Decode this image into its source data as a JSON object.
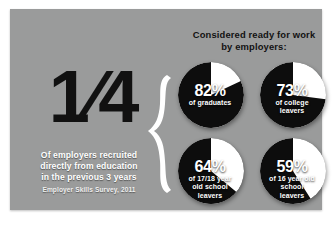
{
  "poster": {
    "background_color": "#9a9b9b",
    "page_background_color": "#ffffff"
  },
  "headline": {
    "fraction": "1⁄4",
    "statement_lines": [
      "Of employers recruited",
      "directly from education",
      "in the previous 3 years"
    ],
    "source": "Employer Skills Survey, 2011",
    "brace_icon": "curly-brace-icon"
  },
  "header": {
    "lines": [
      "Considered ready for work",
      "by employers:"
    ]
  },
  "chart_data": {
    "type": "pie",
    "title": "Considered ready for work by employers:",
    "subtitle": "1/4 of employers recruited directly from education in the previous 3 years",
    "source": "Employer Skills Survey, 2011",
    "value_unit": "%",
    "colors": {
      "filled": "#0d0d0d",
      "remainder": "#ffffff",
      "label": "#ffffff"
    },
    "legend": "none",
    "series": [
      {
        "name": "of graduates",
        "percent": 82,
        "label": "82%",
        "sub_lines": [
          "of graduates"
        ]
      },
      {
        "name": "of college leavers",
        "percent": 73,
        "label": "73%",
        "sub_lines": [
          "of college",
          "leavers"
        ]
      },
      {
        "name": "of 17/18 year old school leavers",
        "percent": 64,
        "label": "64%",
        "sub_lines": [
          "of 17/18 year",
          "old school",
          "leavers"
        ]
      },
      {
        "name": "of 16 year old school leavers",
        "percent": 59,
        "label": "59%",
        "sub_lines": [
          "of 16 year old",
          "school",
          "leavers"
        ]
      }
    ]
  }
}
